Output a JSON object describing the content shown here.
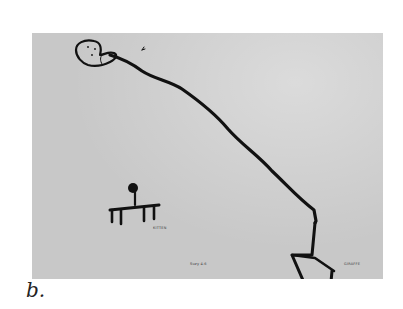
{
  "figure": {
    "caption": "b.",
    "labels": {
      "kitten": "KITTEN",
      "signature": "Suzy 4-6",
      "giraffe": "GIRAFFE"
    },
    "colors": {
      "paper": "#d2d2d2",
      "ink": "#111111",
      "caption": "#222222"
    }
  }
}
